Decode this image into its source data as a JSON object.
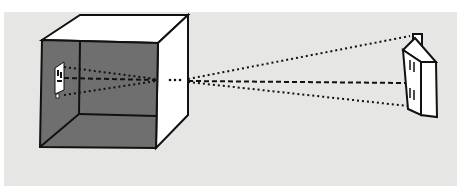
{
  "figure": {
    "title_fragment": "",
    "elements": {
      "box": {
        "label": "camera-obscura-box",
        "interior_color": "#6e6e6e",
        "exterior_color": "#ffffff"
      },
      "pinhole": {
        "label": "pinhole"
      },
      "house": {
        "label": "house-object"
      },
      "projected_image": {
        "label": "inverted-house-image"
      }
    },
    "colors": {
      "background": "#e6e6e4",
      "interior": "#6f6f6f",
      "lines": "#111111"
    }
  }
}
